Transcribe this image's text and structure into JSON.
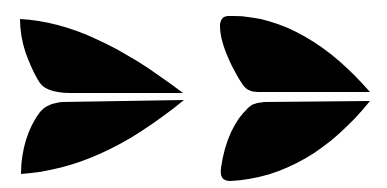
{
  "figure": {
    "background": "#ffffff",
    "fill": "#000000",
    "glyphs": [
      {
        "name": "wing-pair-pointed",
        "variant": "sharp-corner"
      },
      {
        "name": "wing-pair-rounded",
        "variant": "rounded-corner"
      }
    ]
  }
}
